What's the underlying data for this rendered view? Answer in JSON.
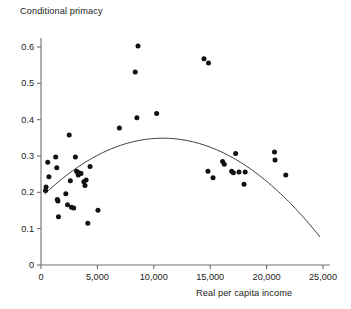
{
  "chart_data": {
    "type": "scatter",
    "title": "",
    "xlabel": "Real per capita income",
    "ylabel": "Conditional primacy",
    "xlim": [
      0,
      25600
    ],
    "ylim": [
      0,
      0.625
    ],
    "xticks": [
      0,
      5000,
      10000,
      15000,
      20000,
      25000
    ],
    "xticklabels": [
      "0",
      "5,000",
      "10,000",
      "15,000",
      "20,000",
      "25,000"
    ],
    "yticks": [
      0,
      0.1,
      0.2,
      0.3,
      0.4,
      0.5,
      0.6
    ],
    "yticklabels": [
      "0",
      "0.1",
      "0.2",
      "0.3",
      "0.4",
      "0.5",
      "0.6"
    ],
    "grid": false,
    "legend": null,
    "marker": {
      "shape": "circle",
      "color": "#111111",
      "size": 5.0
    },
    "points": [
      [
        400,
        0.205
      ],
      [
        450,
        0.215
      ],
      [
        600,
        0.283
      ],
      [
        700,
        0.243
      ],
      [
        1300,
        0.297
      ],
      [
        1400,
        0.268
      ],
      [
        1450,
        0.18
      ],
      [
        1500,
        0.176
      ],
      [
        1550,
        0.133
      ],
      [
        2200,
        0.196
      ],
      [
        2350,
        0.166
      ],
      [
        2600,
        0.232
      ],
      [
        2700,
        0.159
      ],
      [
        2900,
        0.157
      ],
      [
        3050,
        0.297
      ],
      [
        3150,
        0.258
      ],
      [
        3250,
        0.255
      ],
      [
        3300,
        0.248
      ],
      [
        3400,
        0.253
      ],
      [
        3550,
        0.252
      ],
      [
        3800,
        0.229
      ],
      [
        3900,
        0.219
      ],
      [
        4000,
        0.234
      ],
      [
        4150,
        0.115
      ],
      [
        4350,
        0.271
      ],
      [
        5050,
        0.151
      ],
      [
        2500,
        0.358
      ],
      [
        6950,
        0.377
      ],
      [
        8600,
        0.603
      ],
      [
        8350,
        0.531
      ],
      [
        8500,
        0.405
      ],
      [
        10250,
        0.417
      ],
      [
        14450,
        0.568
      ],
      [
        14850,
        0.556
      ],
      [
        14800,
        0.258
      ],
      [
        15250,
        0.24
      ],
      [
        16100,
        0.285
      ],
      [
        16250,
        0.277
      ],
      [
        16900,
        0.258
      ],
      [
        17050,
        0.254
      ],
      [
        17250,
        0.307
      ],
      [
        17550,
        0.256
      ],
      [
        18000,
        0.222
      ],
      [
        18100,
        0.256
      ],
      [
        20700,
        0.311
      ],
      [
        20750,
        0.289
      ],
      [
        21700,
        0.248
      ]
    ],
    "fit_curve": {
      "description": "quadratic fit, inverted-U",
      "peak_x": 10800,
      "peak_y": 0.349,
      "x_start": 350,
      "y_start": 0.196,
      "x_end": 24700,
      "y_end": 0.172,
      "color": "#3a3a3a",
      "width": 1.0
    }
  },
  "axes": {
    "axis_color": "#6e6e6e",
    "tick_length": 4
  }
}
